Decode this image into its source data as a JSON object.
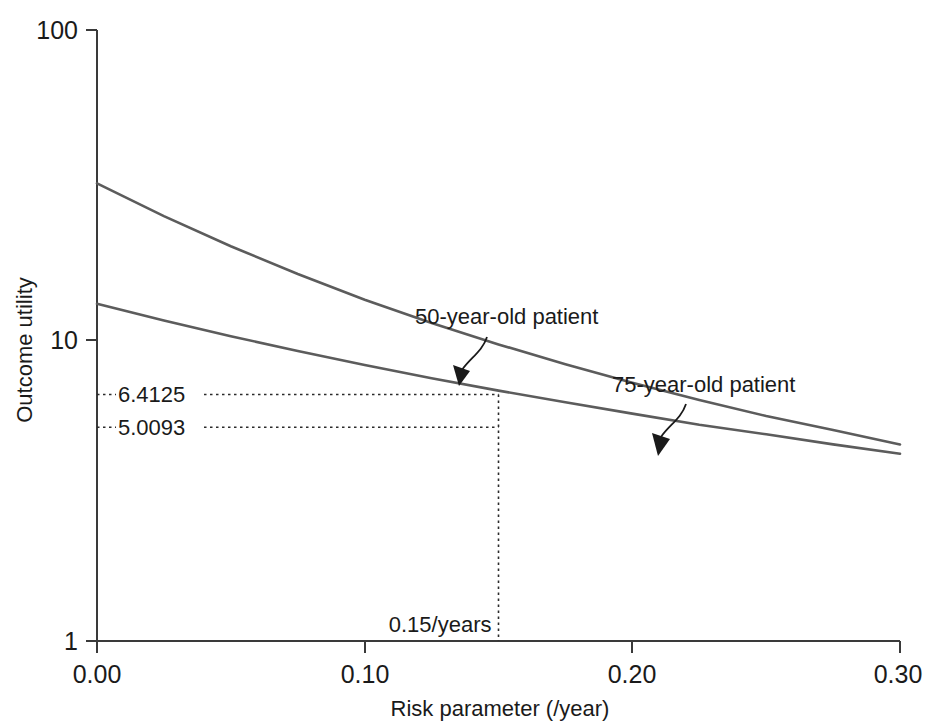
{
  "chart_data": {
    "type": "line",
    "title": "",
    "xlabel": "Risk parameter (/year)",
    "ylabel": "Outcome utility",
    "xlim": [
      0.0,
      0.3
    ],
    "ylim": [
      1,
      100
    ],
    "yscale": "log",
    "grid": false,
    "legend_position": "inline-annotations",
    "xticks": [
      "0.00",
      "0.10",
      "0.20",
      "0.30"
    ],
    "xtick_values": [
      0.0,
      0.1,
      0.2,
      0.3
    ],
    "yticks": [
      "1",
      "10",
      "100"
    ],
    "ytick_values": [
      1,
      10,
      100
    ],
    "series": [
      {
        "name": "50-year-old patient",
        "x": [
          0.0,
          0.025,
          0.05,
          0.075,
          0.1,
          0.125,
          0.15,
          0.175,
          0.2,
          0.225,
          0.25,
          0.275,
          0.3
        ],
        "values": [
          31.5,
          24.6,
          19.6,
          15.9,
          13.1,
          11.0,
          9.35,
          8.05,
          7.0,
          6.15,
          5.45,
          4.9,
          4.4
        ]
      },
      {
        "name": "75-year-old patient",
        "x": [
          0.0,
          0.025,
          0.05,
          0.075,
          0.1,
          0.125,
          0.15,
          0.175,
          0.2,
          0.225,
          0.25,
          0.275,
          0.3
        ],
        "values": [
          12.7,
          11.2,
          9.95,
          8.9,
          8.0,
          7.25,
          6.6,
          6.05,
          5.55,
          5.1,
          4.75,
          4.4,
          4.1
        ]
      }
    ],
    "annotations": [
      {
        "name": "50-year-old patient",
        "text": "50-year-old patient",
        "points_to_x": 0.138,
        "points_to_y": 9.9
      },
      {
        "name": "75-year-old patient",
        "text": "75-year-old patient",
        "points_to_x": 0.196,
        "points_to_y": 5.6
      }
    ],
    "markers": {
      "vertical_guide_label": "0.15/years",
      "vertical_guide_x": 0.15,
      "horizontal_guide_labels": [
        "6.4125",
        "5.0093"
      ],
      "horizontal_guide_values": [
        6.4125,
        5.0093
      ]
    },
    "colors": {
      "curve": "#5c5c5c",
      "axis": "#3a3a3a",
      "text": "#1a1a1a",
      "guide": "#2b2b2b",
      "background": "#ffffff"
    }
  },
  "axes": {
    "y_title": "Outcome utility",
    "x_title": "Risk parameter (/year)",
    "y_tick_top": "100",
    "y_tick_mid": "10",
    "y_tick_bottom": "1",
    "x_tick_0": "0.00",
    "x_tick_1": "0.10",
    "x_tick_2": "0.20",
    "x_tick_3": "0.30"
  },
  "callouts": {
    "upper_curve": "50-year-old patient",
    "lower_curve": "75-year-old patient",
    "value_upper": "6.4125",
    "value_lower": "5.0093",
    "x_marker": "0.15/years"
  }
}
